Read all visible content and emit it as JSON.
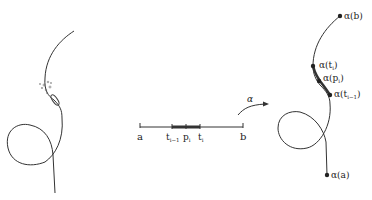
{
  "diagram": {
    "interval": {
      "start_label": "a",
      "end_label": "b",
      "ticks": [
        {
          "label": "t",
          "sub": "i−1"
        },
        {
          "label": "p",
          "sub": "i"
        },
        {
          "label": "t",
          "sub": "i"
        }
      ]
    },
    "map_label": "α",
    "curve_points": [
      {
        "label": "α(b)"
      },
      {
        "label": "α(t",
        "sub": "i",
        "close": ")"
      },
      {
        "label": "α(p",
        "sub": "i",
        "close": ")"
      },
      {
        "label": "α(t",
        "sub": "i−1",
        "close": ")"
      },
      {
        "label": "α(a)"
      }
    ],
    "colors": {
      "stroke": "#333333",
      "background": "#ffffff"
    }
  }
}
